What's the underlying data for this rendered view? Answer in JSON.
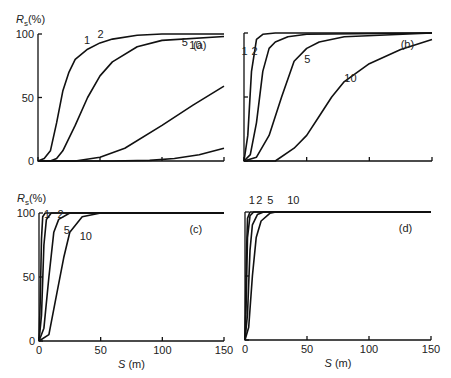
{
  "chart_data": [
    {
      "type": "line",
      "panel": "(a)",
      "ylabel": "R_s (%)",
      "xlabel": "",
      "xlim": [
        0,
        150
      ],
      "ylim": [
        0,
        100
      ],
      "yticks": [
        0,
        50,
        100
      ],
      "xticks": [
        0,
        50,
        100,
        150
      ],
      "show_ytick_labels": true,
      "show_xtick_labels": false,
      "series": [
        {
          "name": "1",
          "x": [
            0,
            5,
            10,
            15,
            20,
            25,
            30,
            40,
            50,
            60,
            80,
            100,
            150
          ],
          "y": [
            0,
            2,
            8,
            30,
            55,
            70,
            80,
            88,
            93,
            96,
            99,
            100,
            100
          ]
        },
        {
          "name": "2",
          "x": [
            0,
            10,
            15,
            20,
            30,
            40,
            50,
            60,
            80,
            100,
            150
          ],
          "y": [
            0,
            0,
            2,
            8,
            28,
            50,
            67,
            78,
            90,
            95,
            98
          ]
        },
        {
          "name": "5",
          "x": [
            0,
            30,
            50,
            70,
            100,
            125,
            150
          ],
          "y": [
            0,
            0,
            3,
            10,
            28,
            44,
            59
          ]
        },
        {
          "name": "10",
          "x": [
            0,
            60,
            90,
            110,
            130,
            150
          ],
          "y": [
            0,
            0,
            0.5,
            2,
            5,
            10
          ]
        }
      ]
    },
    {
      "type": "line",
      "panel": "(b)",
      "xlim": [
        0,
        150
      ],
      "ylim": [
        0,
        100
      ],
      "yticks": [
        0,
        50,
        100
      ],
      "xticks": [
        0,
        50,
        100,
        150
      ],
      "show_ytick_labels": false,
      "show_xtick_labels": false,
      "series": [
        {
          "name": "1",
          "x": [
            0,
            3,
            6,
            10,
            15,
            25,
            50,
            150
          ],
          "y": [
            0,
            20,
            70,
            95,
            99,
            100,
            100,
            100
          ]
        },
        {
          "name": "2",
          "x": [
            0,
            5,
            10,
            15,
            20,
            25,
            35,
            50,
            150
          ],
          "y": [
            0,
            5,
            30,
            70,
            88,
            93,
            97,
            99,
            100
          ]
        },
        {
          "name": "5",
          "x": [
            0,
            10,
            20,
            30,
            40,
            50,
            60,
            80,
            150
          ],
          "y": [
            0,
            3,
            20,
            50,
            78,
            88,
            93,
            97,
            100
          ]
        },
        {
          "name": "10",
          "x": [
            0,
            25,
            40,
            50,
            60,
            70,
            80,
            100,
            125,
            150
          ],
          "y": [
            0,
            0,
            10,
            20,
            35,
            50,
            62,
            76,
            87,
            95
          ]
        }
      ]
    },
    {
      "type": "line",
      "panel": "(c)",
      "ylabel": "R_s (%)",
      "xlabel": "S (m)",
      "xlim": [
        0,
        150
      ],
      "ylim": [
        0,
        100
      ],
      "yticks": [
        0,
        50,
        100
      ],
      "xticks": [
        0,
        50,
        100,
        150
      ],
      "show_ytick_labels": true,
      "show_xtick_labels": true,
      "series": [
        {
          "name": "1",
          "x": [
            0,
            1,
            2,
            3,
            5,
            150
          ],
          "y": [
            0,
            30,
            80,
            97,
            100,
            100
          ]
        },
        {
          "name": "2",
          "x": [
            0,
            2,
            4,
            6,
            10,
            150
          ],
          "y": [
            0,
            20,
            75,
            95,
            100,
            100
          ]
        },
        {
          "name": "5",
          "x": [
            0,
            4,
            8,
            12,
            16,
            25,
            150
          ],
          "y": [
            0,
            10,
            50,
            85,
            95,
            100,
            100
          ]
        },
        {
          "name": "10",
          "x": [
            0,
            8,
            15,
            20,
            25,
            35,
            50,
            150
          ],
          "y": [
            0,
            5,
            40,
            65,
            85,
            97,
            100,
            100
          ]
        }
      ]
    },
    {
      "type": "line",
      "panel": "(d)",
      "xlabel": "S (m)",
      "xlim": [
        0,
        150
      ],
      "ylim": [
        0,
        100
      ],
      "yticks": [
        0,
        50,
        100
      ],
      "xticks": [
        0,
        50,
        100,
        150
      ],
      "show_ytick_labels": false,
      "show_xtick_labels": true,
      "series": [
        {
          "name": "1",
          "x": [
            0,
            1,
            2,
            4,
            150
          ],
          "y": [
            0,
            60,
            95,
            100,
            100
          ]
        },
        {
          "name": "2",
          "x": [
            0,
            1,
            2,
            4,
            7,
            150
          ],
          "y": [
            0,
            30,
            80,
            97,
            100,
            100
          ]
        },
        {
          "name": "5",
          "x": [
            0,
            2,
            4,
            6,
            10,
            15,
            150
          ],
          "y": [
            0,
            20,
            70,
            90,
            98,
            100,
            100
          ]
        },
        {
          "name": "10",
          "x": [
            0,
            3,
            6,
            9,
            13,
            20,
            25,
            150
          ],
          "y": [
            0,
            10,
            50,
            80,
            93,
            99,
            100,
            100
          ]
        }
      ]
    }
  ],
  "labels": {
    "ylabel_R": "R",
    "ylabel_sub": "s",
    "ylabel_unit": "(%)",
    "xlabel": "S (m)",
    "panels": [
      "(a)",
      "(b)",
      "(c)",
      "(d)"
    ],
    "yticks": [
      "0",
      "50",
      "100"
    ],
    "xticks": [
      "0",
      "50",
      "100",
      "150"
    ],
    "curve_names": [
      "1",
      "2",
      "5",
      "10"
    ]
  }
}
